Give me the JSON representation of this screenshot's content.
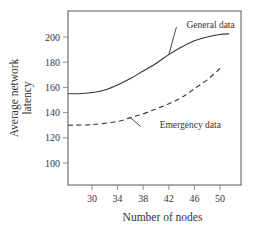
{
  "chart_data": {
    "type": "line",
    "title": "",
    "xlabel": "Number of nodes",
    "ylabel_lines": [
      "Average network",
      "latency"
    ],
    "ylabel": "Average network latency",
    "xlim": [
      26.25,
      53.4
    ],
    "ylim": [
      82.5,
      221
    ],
    "xticks": [
      30,
      34,
      38,
      42,
      46,
      50
    ],
    "yticks": [
      100,
      120,
      140,
      160,
      180,
      200
    ],
    "grid": false,
    "legend": "inline annotations",
    "series": [
      {
        "name": "General data",
        "style": "solid",
        "color": "#333333",
        "x": [
          26.25,
          28,
          30,
          32,
          34,
          36,
          38,
          40,
          42,
          44,
          46,
          48,
          50,
          51.4
        ],
        "y": [
          155,
          155,
          156,
          158,
          162,
          167,
          173,
          179,
          186,
          192,
          197,
          200,
          202,
          202.5
        ]
      },
      {
        "name": "Emergency data",
        "style": "dashed",
        "color": "#333333",
        "x": [
          26.25,
          30,
          34,
          36,
          38,
          40,
          42,
          44,
          46,
          48,
          50
        ],
        "y": [
          130,
          130.5,
          133,
          136,
          139,
          143,
          147,
          152,
          159,
          166,
          175
        ]
      }
    ],
    "annotations": [
      {
        "text": "General data",
        "series": 0,
        "anchor_x": 42,
        "anchor_y": 186,
        "label_x": 43.2,
        "label_y": 208
      },
      {
        "text": "Emergency data",
        "series": 1,
        "anchor_x": 36,
        "anchor_y": 136,
        "label_x": 37.6,
        "label_y": 129
      }
    ]
  },
  "layout": {
    "plot": {
      "left": 68,
      "top": 11,
      "right": 241,
      "bottom": 185
    },
    "x_px": {
      "v0": 30,
      "p0": 92,
      "v1": 50,
      "p1": 220
    },
    "y_px": {
      "v0": 200,
      "p0": 37,
      "v1": 100,
      "p1": 163
    }
  }
}
